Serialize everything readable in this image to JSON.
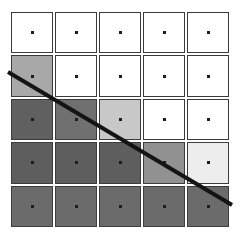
{
  "figure": {
    "title": "",
    "background_color": "#ffffff",
    "width": 240,
    "height": 239
  },
  "grid": {
    "rows": 5,
    "columns": 5,
    "border_color": "#3c3c3c",
    "gap_color": "#ffffff",
    "dot_color": "#1c1c1c",
    "cell_count": 25
  },
  "diagonal_line": {
    "name": "diagonal-divider-line",
    "color": "#141414",
    "thickness": 4,
    "x1": 8,
    "y1": 72,
    "x2": 232,
    "y2": 205
  },
  "chart_data": {
    "type": "heatmap",
    "title": "",
    "xlabel": "",
    "ylabel": "",
    "categories_x": [
      "1",
      "2",
      "3",
      "4",
      "5"
    ],
    "categories_y": [
      "1",
      "2",
      "3",
      "4",
      "5"
    ],
    "colorscale": "grayscale",
    "value_range": [
      0,
      1
    ],
    "grid": true,
    "legend": "none",
    "cells": [
      {
        "row": 1,
        "col": 1,
        "color": "#ffffff",
        "value": 1.0
      },
      {
        "row": 1,
        "col": 2,
        "color": "#ffffff",
        "value": 1.0
      },
      {
        "row": 1,
        "col": 3,
        "color": "#ffffff",
        "value": 1.0
      },
      {
        "row": 1,
        "col": 4,
        "color": "#ffffff",
        "value": 1.0
      },
      {
        "row": 1,
        "col": 5,
        "color": "#ffffff",
        "value": 1.0
      },
      {
        "row": 2,
        "col": 1,
        "color": "#a8a8a8",
        "value": 0.66
      },
      {
        "row": 2,
        "col": 2,
        "color": "#ffffff",
        "value": 1.0
      },
      {
        "row": 2,
        "col": 3,
        "color": "#ffffff",
        "value": 1.0
      },
      {
        "row": 2,
        "col": 4,
        "color": "#ffffff",
        "value": 1.0
      },
      {
        "row": 2,
        "col": 5,
        "color": "#ffffff",
        "value": 1.0
      },
      {
        "row": 3,
        "col": 1,
        "color": "#606060",
        "value": 0.38
      },
      {
        "row": 3,
        "col": 2,
        "color": "#707070",
        "value": 0.44
      },
      {
        "row": 3,
        "col": 3,
        "color": "#c8c8c8",
        "value": 0.78
      },
      {
        "row": 3,
        "col": 4,
        "color": "#ffffff",
        "value": 1.0
      },
      {
        "row": 3,
        "col": 5,
        "color": "#ffffff",
        "value": 1.0
      },
      {
        "row": 4,
        "col": 1,
        "color": "#5e5e5e",
        "value": 0.37
      },
      {
        "row": 4,
        "col": 2,
        "color": "#5e5e5e",
        "value": 0.37
      },
      {
        "row": 4,
        "col": 3,
        "color": "#5e5e5e",
        "value": 0.37
      },
      {
        "row": 4,
        "col": 4,
        "color": "#919191",
        "value": 0.57
      },
      {
        "row": 4,
        "col": 5,
        "color": "#ededed",
        "value": 0.93
      },
      {
        "row": 5,
        "col": 1,
        "color": "#6b6b6b",
        "value": 0.42
      },
      {
        "row": 5,
        "col": 2,
        "color": "#6b6b6b",
        "value": 0.42
      },
      {
        "row": 5,
        "col": 3,
        "color": "#6b6b6b",
        "value": 0.42
      },
      {
        "row": 5,
        "col": 4,
        "color": "#6b6b6b",
        "value": 0.42
      },
      {
        "row": 5,
        "col": 5,
        "color": "#6b6b6b",
        "value": 0.42
      }
    ]
  }
}
